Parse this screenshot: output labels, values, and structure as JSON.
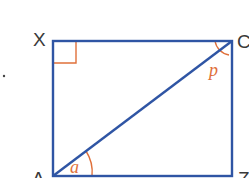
{
  "diagram": {
    "type": "geometry",
    "shape": "rectangle with diagonal",
    "vertices": {
      "top_left": "X",
      "top_right": "C",
      "bottom_left": "A",
      "bottom_right": "Z"
    },
    "angles": {
      "at_C": "p",
      "at_A": "a"
    },
    "right_angle_marker": "X",
    "colors": {
      "lines": "#2f55a4",
      "angle_marks": "#e0703a",
      "labels": "#3a3a3a"
    }
  }
}
